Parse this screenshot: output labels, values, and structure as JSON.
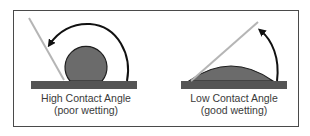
{
  "diagram": {
    "panels": [
      {
        "id": "high",
        "label_line1": "High Contact Angle",
        "label_line2": "(poor wetting)",
        "droplet_shape": "near-spherical",
        "angle_type": "obtuse"
      },
      {
        "id": "low",
        "label_line1": "Low Contact Angle",
        "label_line2": "(good wetting)",
        "droplet_shape": "flat-dome",
        "angle_type": "acute"
      }
    ],
    "colors": {
      "frame": "#4a4a4a",
      "substrate": "#555555",
      "droplet": "#6b6b6b",
      "droplet_outline": "#1e1e1e",
      "tangent_line": "#b5b5b5",
      "arrow": "#111111",
      "text": "#3a3a3a"
    }
  }
}
